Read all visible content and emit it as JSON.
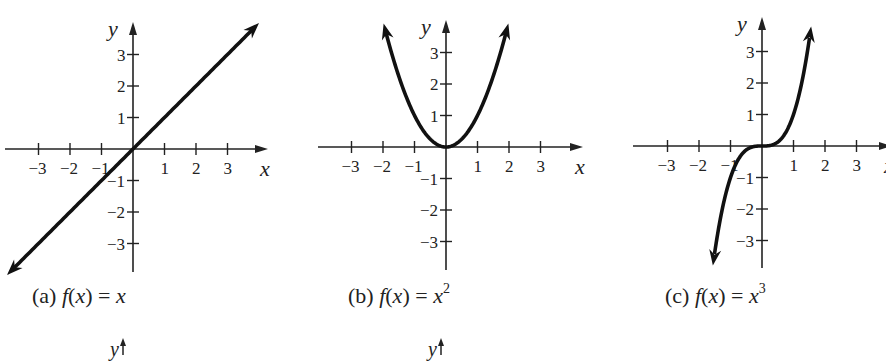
{
  "figure": {
    "panels": [
      {
        "id": "a",
        "caption_prefix": "(a)",
        "caption_fn": "f",
        "caption_arg": "x",
        "caption_eq": "=",
        "caption_rhs": "x",
        "caption_exp": "",
        "function": "linear",
        "x_axis_label": "x",
        "y_axis_label": "y"
      },
      {
        "id": "b",
        "caption_prefix": "(b)",
        "caption_fn": "f",
        "caption_arg": "x",
        "caption_eq": "=",
        "caption_rhs": "x",
        "caption_exp": "2",
        "function": "square",
        "x_axis_label": "x",
        "y_axis_label": "y"
      },
      {
        "id": "c",
        "caption_prefix": "(c)",
        "caption_fn": "f",
        "caption_arg": "x",
        "caption_eq": "=",
        "caption_rhs": "x",
        "caption_exp": "3",
        "function": "cube",
        "x_axis_label": "x",
        "y_axis_label": "y"
      }
    ],
    "x_ticks": [
      "−3",
      "−2",
      "−1",
      "1",
      "2",
      "3"
    ],
    "y_ticks": [
      "3",
      "2",
      "1",
      "−1",
      "−2",
      "−3"
    ],
    "partial_next_row_labels": [
      "y",
      "y"
    ]
  },
  "chart_data": [
    {
      "type": "line",
      "title": "(a) f(x) = x",
      "xlabel": "x",
      "ylabel": "y",
      "xlim": [
        -4,
        4
      ],
      "ylim": [
        -3.8,
        3.8
      ],
      "x_ticks": [
        -3,
        -2,
        -1,
        1,
        2,
        3
      ],
      "y_ticks": [
        -3,
        -2,
        -1,
        1,
        2,
        3
      ],
      "grid": false,
      "x": [
        -4,
        -3,
        -2,
        -1,
        0,
        1,
        2,
        3,
        4
      ],
      "series": [
        {
          "name": "f(x) = x",
          "values": [
            -4,
            -3,
            -2,
            -1,
            0,
            1,
            2,
            3,
            4
          ]
        }
      ],
      "arrows_at_ends": true
    },
    {
      "type": "line",
      "title": "(b) f(x) = x^2",
      "xlabel": "x",
      "ylabel": "y",
      "xlim": [
        -4,
        4
      ],
      "ylim": [
        -3.8,
        3.8
      ],
      "x_ticks": [
        -3,
        -2,
        -1,
        1,
        2,
        3
      ],
      "y_ticks": [
        -3,
        -2,
        -1,
        1,
        2,
        3
      ],
      "grid": false,
      "x": [
        -2,
        -1.5,
        -1,
        -0.5,
        0,
        0.5,
        1,
        1.5,
        2
      ],
      "series": [
        {
          "name": "f(x) = x^2",
          "values": [
            4,
            2.25,
            1,
            0.25,
            0,
            0.25,
            1,
            2.25,
            4
          ]
        }
      ],
      "arrows_at_ends": true
    },
    {
      "type": "line",
      "title": "(c) f(x) = x^3",
      "xlabel": "x",
      "ylabel": "y",
      "xlim": [
        -4,
        4
      ],
      "ylim": [
        -3.8,
        3.8
      ],
      "x_ticks": [
        -3,
        -2,
        -1,
        1,
        2,
        3
      ],
      "y_ticks": [
        -3,
        -2,
        -1,
        1,
        2,
        3
      ],
      "grid": false,
      "x": [
        -1.55,
        -1.25,
        -1,
        -0.5,
        0,
        0.5,
        1,
        1.25,
        1.55
      ],
      "series": [
        {
          "name": "f(x) = x^3",
          "values": [
            -3.72,
            -1.95,
            -1,
            -0.125,
            0,
            0.125,
            1,
            1.95,
            3.72
          ]
        }
      ],
      "arrows_at_ends": true
    }
  ]
}
